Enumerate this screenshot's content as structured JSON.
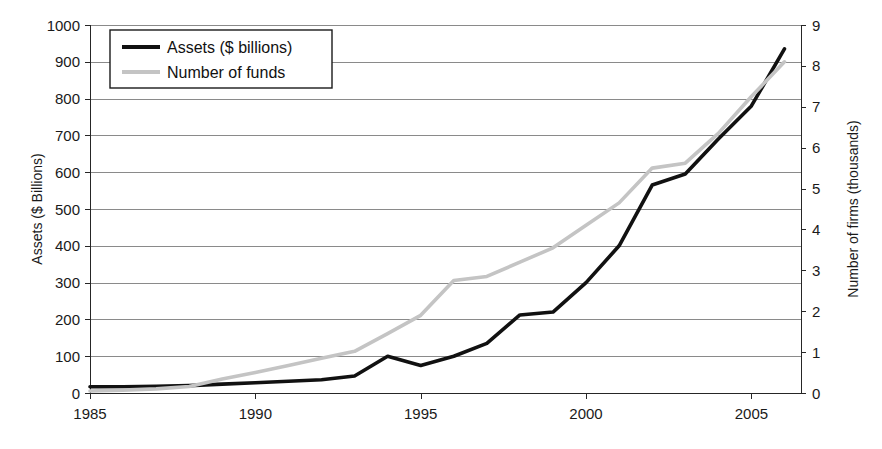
{
  "chart_data": {
    "type": "line",
    "title": "",
    "subtitle": "",
    "xlabel": "",
    "ylabel": "Assets ($ Billions)",
    "y2label": "Number of firms (thousands)",
    "grid": true,
    "legend_position": "top-left",
    "xlim": [
      1985,
      2006.5
    ],
    "ylim": [
      0,
      1000
    ],
    "y2lim": [
      0,
      9
    ],
    "x_tick_labels": [
      "1985",
      "1990",
      "1995",
      "2000",
      "2005"
    ],
    "x_ticks": [
      1985,
      1990,
      1995,
      2000,
      2005
    ],
    "y_tick_labels": [
      "0",
      "100",
      "200",
      "300",
      "400",
      "500",
      "600",
      "700",
      "800",
      "900",
      "1000"
    ],
    "y_ticks": [
      0,
      100,
      200,
      300,
      400,
      500,
      600,
      700,
      800,
      900,
      1000
    ],
    "y2_tick_labels": [
      "0",
      "1",
      "2",
      "3",
      "4",
      "5",
      "6",
      "7",
      "8",
      "9"
    ],
    "y2_ticks": [
      0,
      1,
      2,
      3,
      4,
      5,
      6,
      7,
      8,
      9
    ],
    "series": [
      {
        "name": "Assets ($ billions)",
        "axis": "left",
        "color": "#111111",
        "width": 3.6,
        "x": [
          1985,
          1986,
          1987,
          1988,
          1989,
          1990,
          1991,
          1992,
          1993,
          1994,
          1995,
          1996,
          1997,
          1998,
          1999,
          2000,
          2001,
          2002,
          2003,
          2004,
          2005,
          2006
        ],
        "values": [
          17,
          17,
          18,
          20,
          24,
          28,
          32,
          36,
          46,
          100,
          75,
          100,
          135,
          212,
          220,
          300,
          400,
          565,
          595,
          690,
          780,
          935
        ]
      },
      {
        "name": "Number of funds",
        "axis": "right",
        "color": "#c4c4c4",
        "width": 3.6,
        "x": [
          1985,
          1986,
          1987,
          1988,
          1989,
          1990,
          1991,
          1992,
          1993,
          1994,
          1995,
          1996,
          1997,
          1998,
          1999,
          2000,
          2001,
          2002,
          2003,
          2004,
          2005,
          2006
        ],
        "values": [
          0.05,
          0.07,
          0.1,
          0.16,
          0.34,
          0.5,
          0.67,
          0.85,
          1.02,
          1.45,
          1.9,
          2.75,
          2.85,
          3.2,
          3.55,
          4.1,
          4.65,
          5.5,
          5.62,
          6.35,
          7.25,
          8.1
        ]
      }
    ]
  },
  "legend": {
    "entries": [
      {
        "label": "Assets ($ billions)",
        "color": "#111111"
      },
      {
        "label": "Number of funds",
        "color": "#c4c4c4"
      }
    ]
  },
  "axes": {
    "left_title": "Assets ($ Billions)",
    "right_title": "Number of firms (thousands)"
  }
}
